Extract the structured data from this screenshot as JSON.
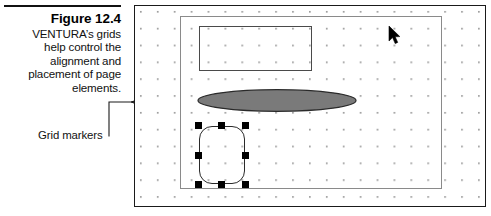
{
  "figure": {
    "number_label": "Figure 12.4",
    "caption_lines": [
      "VENTURA’s grids",
      "help control the",
      "alignment and",
      "placement of page",
      "elements."
    ],
    "caption_full": "VENTURA’s grids help control the alignment and placement of page elements."
  },
  "annotations": {
    "grid_markers_label": "Grid markers",
    "leader_description": "three-pronged leader line pointing at the page grid markers"
  },
  "page_canvas": {
    "outer_border_color": "#1a1a1a",
    "background_color": "#ffffff",
    "margin_frame_color": "#8a8a8a",
    "grid": {
      "dot_color": "#9a9a9a",
      "dot_size_px": 1.6,
      "spacing_x_px": 17,
      "spacing_y_px": 17,
      "offset_x_px": 8,
      "offset_y_px": 8
    },
    "objects": [
      {
        "name": "text-frame-rectangle",
        "type": "rectangle",
        "stroke": "#4a4a4a",
        "fill": "none",
        "selected": false
      },
      {
        "name": "ellipse-graphic",
        "type": "ellipse",
        "stroke": "#2a2a2a",
        "fill": "#7a7a7a",
        "selected": false
      },
      {
        "name": "rounded-rectangle-graphic",
        "type": "rounded-rectangle",
        "stroke": "#2a2a2a",
        "fill": "none",
        "selected": true,
        "handle_color": "#000000",
        "handle_count": 8
      }
    ],
    "cursor": {
      "name": "mouse-pointer",
      "color": "#000000"
    }
  }
}
